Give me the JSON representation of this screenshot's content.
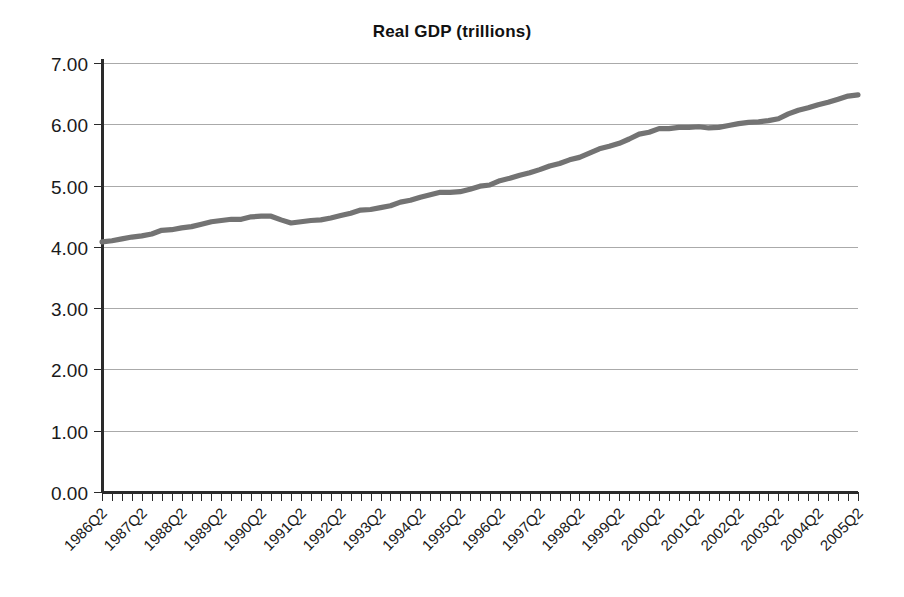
{
  "chart_data": {
    "type": "line",
    "title": "Real GDP (trillions)",
    "xlabel": "",
    "ylabel": "",
    "ylim": [
      0.0,
      7.0
    ],
    "ytick_step": 1.0,
    "ytick_labels": [
      "0.00",
      "1.00",
      "2.00",
      "3.00",
      "4.00",
      "5.00",
      "6.00",
      "7.00"
    ],
    "ytick_values": [
      0.0,
      1.0,
      2.0,
      3.0,
      4.0,
      5.0,
      6.0,
      7.0
    ],
    "grid": true,
    "grid_axis": "y",
    "legend": false,
    "legend_position": "none",
    "line_color": "#737373",
    "axis_color": "#2a2a2a",
    "grid_color": "#aaaaaa",
    "background_color": "#ffffff",
    "x_major_tick_labels": [
      "1986Q2",
      "1987Q2",
      "1988Q2",
      "1989Q2",
      "1990Q2",
      "1991Q2",
      "1992Q2",
      "1993Q2",
      "1994Q2",
      "1995Q2",
      "1996Q2",
      "1997Q2",
      "1998Q2",
      "1999Q2",
      "2000Q2",
      "2001Q2",
      "2002Q2",
      "2003Q2",
      "2004Q2",
      "2005Q2"
    ],
    "x_label_rotation_deg": 45,
    "x_minor_ticks_per_label": 4,
    "x_tick_frequency": "quarterly",
    "series": [
      {
        "name": "Real GDP (trillions)",
        "x": [
          "1986Q2",
          "1986Q3",
          "1986Q4",
          "1987Q1",
          "1987Q2",
          "1987Q3",
          "1987Q4",
          "1988Q1",
          "1988Q2",
          "1988Q3",
          "1988Q4",
          "1989Q1",
          "1989Q2",
          "1989Q3",
          "1989Q4",
          "1990Q1",
          "1990Q2",
          "1990Q3",
          "1990Q4",
          "1991Q1",
          "1991Q2",
          "1991Q3",
          "1991Q4",
          "1992Q1",
          "1992Q2",
          "1992Q3",
          "1992Q4",
          "1993Q1",
          "1993Q2",
          "1993Q3",
          "1993Q4",
          "1994Q1",
          "1994Q2",
          "1994Q3",
          "1994Q4",
          "1995Q1",
          "1995Q2",
          "1995Q3",
          "1995Q4",
          "1996Q1",
          "1996Q2",
          "1996Q3",
          "1996Q4",
          "1997Q1",
          "1997Q2",
          "1997Q3",
          "1997Q4",
          "1998Q1",
          "1998Q2",
          "1998Q3",
          "1998Q4",
          "1999Q1",
          "1999Q2",
          "1999Q3",
          "1999Q4",
          "2000Q1",
          "2000Q2",
          "2000Q3",
          "2000Q4",
          "2001Q1",
          "2001Q2",
          "2001Q3",
          "2001Q4",
          "2002Q1",
          "2002Q2",
          "2002Q3",
          "2002Q4",
          "2003Q1",
          "2003Q2",
          "2003Q3",
          "2003Q4",
          "2004Q1",
          "2004Q2",
          "2004Q3",
          "2004Q4",
          "2005Q1",
          "2005Q2"
        ],
        "values": [
          4.08,
          4.1,
          4.13,
          4.16,
          4.18,
          4.21,
          4.27,
          4.28,
          4.31,
          4.33,
          4.37,
          4.41,
          4.43,
          4.45,
          4.45,
          4.49,
          4.5,
          4.5,
          4.44,
          4.39,
          4.41,
          4.43,
          4.44,
          4.47,
          4.51,
          4.55,
          4.6,
          4.61,
          4.64,
          4.67,
          4.73,
          4.76,
          4.81,
          4.85,
          4.89,
          4.89,
          4.9,
          4.94,
          4.99,
          5.01,
          5.08,
          5.12,
          5.17,
          5.21,
          5.26,
          5.32,
          5.36,
          5.42,
          5.46,
          5.53,
          5.6,
          5.64,
          5.69,
          5.76,
          5.84,
          5.87,
          5.93,
          5.93,
          5.95,
          5.95,
          5.96,
          5.94,
          5.95,
          5.98,
          6.01,
          6.03,
          6.04,
          6.06,
          6.09,
          6.17,
          6.23,
          6.27,
          6.32,
          6.36,
          6.41,
          6.46,
          6.48
        ]
      }
    ]
  }
}
